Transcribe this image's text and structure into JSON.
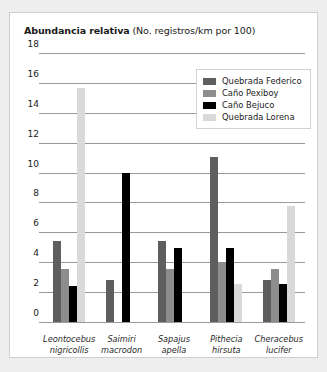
{
  "chart_data": {
    "type": "bar",
    "title": "Abundancia relativa (No. registros/km por 100)",
    "title_bold_part": "Abundancia relativa",
    "title_rest_part": " (No. registros/km por 100)",
    "xlabel": "",
    "ylabel": "",
    "ylim": [
      0,
      18
    ],
    "yticks": [
      0,
      2,
      4,
      6,
      8,
      10,
      12,
      14,
      16,
      18
    ],
    "grid": true,
    "legend_position": "top-right",
    "categories": [
      "Leontocebus nigricollis",
      "Saimiri macrodon",
      "Sapajus apella",
      "Pithecia hirsuta",
      "Cheracebus lucifer"
    ],
    "category_lines": [
      [
        "Leontocebus",
        "nigricollis"
      ],
      [
        "Saimiri",
        "macrodon"
      ],
      [
        "Sapajus",
        "apella"
      ],
      [
        "Pithecia",
        "hirsuta"
      ],
      [
        "Cheracebus",
        "lucifer"
      ]
    ],
    "series": [
      {
        "name": "Quebrada Federico",
        "color": "#5e5e5e",
        "values": [
          5.5,
          2.85,
          5.5,
          11.1,
          2.85
        ]
      },
      {
        "name": "Caño Pexiboy",
        "color": "#8d8d8d",
        "values": [
          3.6,
          0,
          3.6,
          4.1,
          3.6
        ]
      },
      {
        "name": "Caño Bejuco",
        "color": "#000000",
        "values": [
          2.5,
          10.05,
          5.0,
          5.0,
          2.6
        ]
      },
      {
        "name": "Quebrada Lorena",
        "color": "#d9d9d9",
        "values": [
          15.75,
          0,
          0,
          2.6,
          7.8
        ]
      }
    ]
  }
}
